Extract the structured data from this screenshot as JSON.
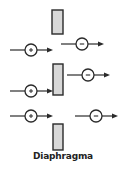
{
  "diagram": {
    "label": "Diaphragma",
    "colors": {
      "stroke": "#2a2a2a",
      "diaphragm_fill": "#d8d8d8"
    },
    "diaphragm_segments": [
      {
        "x": 52,
        "y": 10,
        "w": 11,
        "h": 24
      },
      {
        "x": 53,
        "y": 64,
        "w": 10,
        "h": 31
      },
      {
        "x": 53,
        "y": 124,
        "w": 10,
        "h": 26
      }
    ],
    "ions": [
      {
        "charge": "+",
        "cx": 31,
        "cy": 50
      },
      {
        "charge": "-",
        "cx": 82,
        "cy": 44
      },
      {
        "charge": "-",
        "cx": 88,
        "cy": 75
      },
      {
        "charge": "+",
        "cx": 31,
        "cy": 91
      },
      {
        "charge": "+",
        "cx": 31,
        "cy": 116
      },
      {
        "charge": "-",
        "cx": 96,
        "cy": 116
      }
    ]
  }
}
